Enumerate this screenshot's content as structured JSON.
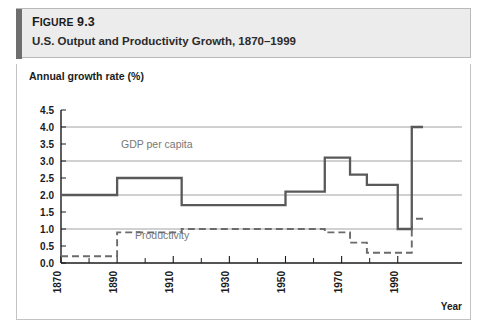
{
  "figure": {
    "number_prefix": "F",
    "number_rest": "IGURE",
    "number_value": "9.3",
    "caption": "U.S. Output and Productivity Growth, 1870–1999"
  },
  "colors": {
    "header_background": "#ececec",
    "header_accent": "#6e6e6e",
    "frame_border": "#c3c3c3",
    "gdp_line": "#595959",
    "productivity_line": "#6b6b6b",
    "gridline": "#8a8a8a",
    "annotation_text": "#777777",
    "axis": "#1b1b1b"
  },
  "chart_data": {
    "type": "line",
    "title": "U.S. Output and Productivity Growth, 1870–1999",
    "xlabel": "Year",
    "ylabel": "Annual growth rate (%)",
    "xlim": [
      1870,
      1999
    ],
    "ylim": [
      0.0,
      4.5
    ],
    "grid": true,
    "gridlines_y": [
      1.0,
      2.0,
      3.0,
      4.0
    ],
    "legend_position": "inline-annotation",
    "step_style": "post",
    "ytick_labels": [
      "4.5",
      "4.0",
      "3.5",
      "3.0",
      "2.5",
      "2.0",
      "1.5",
      "1.0",
      "0.5",
      "0.0"
    ],
    "ytick_values": [
      4.5,
      4.0,
      3.5,
      3.0,
      2.5,
      2.0,
      1.5,
      1.0,
      0.5,
      0.0
    ],
    "xtick_labels": [
      "1870",
      "1890",
      "1910",
      "1930",
      "1950",
      "1970",
      "1990"
    ],
    "xtick_values": [
      1870,
      1890,
      1910,
      1930,
      1950,
      1970,
      1990
    ],
    "xtick_minor_values": [
      1880,
      1900,
      1920,
      1940,
      1960,
      1980
    ],
    "series": [
      {
        "name": "GDP per capita",
        "style": "solid",
        "color": "#595959",
        "annotation": "GDP per capita",
        "segments": [
          {
            "start": 1870,
            "end": 1890,
            "value": 2.0
          },
          {
            "start": 1890,
            "end": 1913,
            "value": 2.5
          },
          {
            "start": 1913,
            "end": 1950,
            "value": 1.7
          },
          {
            "start": 1950,
            "end": 1964,
            "value": 2.1
          },
          {
            "start": 1964,
            "end": 1973,
            "value": 3.1
          },
          {
            "start": 1973,
            "end": 1979,
            "value": 2.6
          },
          {
            "start": 1979,
            "end": 1990,
            "value": 2.3
          },
          {
            "start": 1990,
            "end": 1995,
            "value": 1.0
          },
          {
            "start": 1995,
            "end": 1999,
            "value": 4.0
          }
        ]
      },
      {
        "name": "Productivity",
        "style": "dashed",
        "color": "#6b6b6b",
        "annotation": "Productivity",
        "segments": [
          {
            "start": 1870,
            "end": 1890,
            "value": 0.2
          },
          {
            "start": 1890,
            "end": 1913,
            "value": 0.9
          },
          {
            "start": 1913,
            "end": 1964,
            "value": 1.0
          },
          {
            "start": 1964,
            "end": 1973,
            "value": 0.9
          },
          {
            "start": 1973,
            "end": 1979,
            "value": 0.6
          },
          {
            "start": 1979,
            "end": 1995,
            "value": 0.3
          },
          {
            "start": 1995,
            "end": 1999,
            "value": 1.3
          }
        ]
      }
    ]
  }
}
